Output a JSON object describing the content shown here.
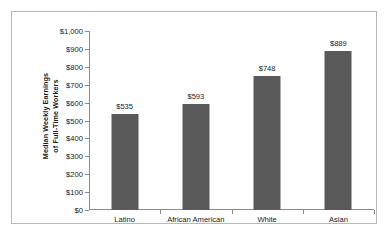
{
  "chart_data": {
    "type": "bar",
    "title": "",
    "subtitle": "",
    "xlabel": "",
    "ylabel": "Median Weekly Earnings of Full-Time Workers",
    "ylabel_lines": [
      "Median Weekly Earnings",
      "of Full-Time Workers"
    ],
    "categories": [
      "Latino",
      "African American",
      "White",
      "Asian"
    ],
    "values": [
      535,
      593,
      748,
      889
    ],
    "value_labels": [
      "$535",
      "$593",
      "$748",
      "$889"
    ],
    "ylim": [
      0,
      1000
    ],
    "ytick_values": [
      0,
      100,
      200,
      300,
      400,
      500,
      600,
      700,
      800,
      900,
      1000
    ],
    "ytick_labels": [
      "$0",
      "$100",
      "$200",
      "$300",
      "$400",
      "$500",
      "$600",
      "$700",
      "$800",
      "$900",
      "$1,000"
    ],
    "grid": false,
    "legend": false,
    "legend_position": "none",
    "bar_color": "#595959",
    "axis_color": "#8c8c8c",
    "text_color": "#1a1a1a",
    "frame_color": "#b8b8b8",
    "background_color": "#ffffff"
  }
}
